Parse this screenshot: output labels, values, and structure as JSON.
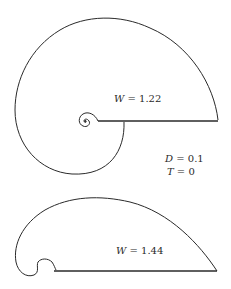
{
  "figure": {
    "top_curve": {
      "label_var": "W",
      "label_eq": " = 1.22"
    },
    "params": {
      "d_var": "D",
      "d_eq": " = 0.1",
      "t_var": "T",
      "t_eq": " = 0"
    },
    "bottom_curve": {
      "label_var": "W",
      "label_eq": " = 1.44"
    },
    "stroke_color": "#2a2a2a"
  }
}
